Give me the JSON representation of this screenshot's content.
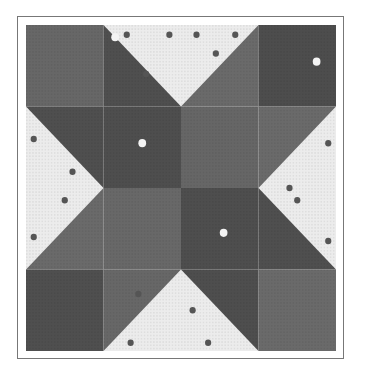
{
  "image": {
    "subject": "Quilt block photograph, star pattern (grayscale)",
    "grid": 4,
    "colors": {
      "dark_print": "#4f4f4f",
      "medium_solid": "#6a6a6a",
      "light": "#ececec",
      "frame": "#777777",
      "dot": "#555555"
    }
  }
}
